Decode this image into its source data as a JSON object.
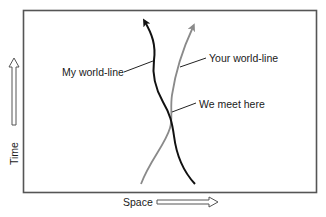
{
  "diagram": {
    "type": "spacetime-diagram",
    "axes": {
      "x_label": "Space",
      "y_label": "Time"
    },
    "labels": {
      "my_world_line": "My world-line",
      "your_world_line": "Your world-line",
      "meeting_point": "We meet here"
    },
    "colors": {
      "frame": "#555555",
      "my_line": "#111111",
      "your_line": "#8a8a8a",
      "leader": "#222222",
      "axis_arrow": "#555555"
    }
  }
}
